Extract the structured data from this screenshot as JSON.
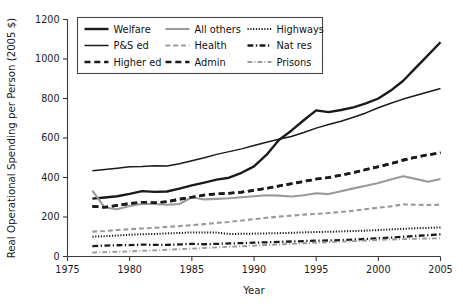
{
  "chart_data": {
    "type": "line",
    "title": "",
    "xlabel": "Year",
    "ylabel": "Real Operational Spending per Person (2005 $)",
    "xlim": [
      1975,
      2005
    ],
    "ylim": [
      0,
      1200
    ],
    "xticks": [
      1975,
      1980,
      1985,
      1990,
      1995,
      2000,
      2005
    ],
    "yticks": [
      0,
      200,
      400,
      600,
      800,
      1000,
      1200
    ],
    "grid": false,
    "legend_position": "top-left",
    "x": [
      1977,
      1978,
      1979,
      1980,
      1981,
      1982,
      1983,
      1984,
      1985,
      1986,
      1987,
      1988,
      1989,
      1990,
      1991,
      1992,
      1993,
      1994,
      1995,
      1996,
      1997,
      1998,
      1999,
      2000,
      2001,
      2002,
      2003,
      2004,
      2005
    ],
    "series": [
      {
        "name": "Welfare",
        "style": "solid",
        "color": "#1a1a1a",
        "width": 2.4,
        "values": [
          293,
          299,
          305,
          317,
          331,
          327,
          329,
          344,
          360,
          374,
          389,
          399,
          424,
          456,
          514,
          590,
          637,
          690,
          740,
          731,
          742,
          755,
          775,
          800,
          840,
          890,
          955,
          1020,
          1085
        ]
      },
      {
        "name": "P&S ed",
        "style": "solid",
        "color": "#1a1a1a",
        "width": 1.5,
        "values": [
          434,
          440,
          447,
          454,
          456,
          460,
          458,
          470,
          485,
          500,
          517,
          531,
          545,
          562,
          578,
          594,
          608,
          628,
          650,
          668,
          685,
          705,
          727,
          753,
          776,
          797,
          815,
          833,
          851
        ]
      },
      {
        "name": "Higher ed",
        "style": "dashed",
        "color": "#1a1a1a",
        "width": 2.6,
        "values": [
          254,
          249,
          259,
          268,
          275,
          272,
          277,
          290,
          300,
          311,
          317,
          320,
          326,
          335,
          345,
          357,
          368,
          380,
          392,
          400,
          412,
          425,
          440,
          455,
          470,
          488,
          503,
          515,
          525
        ]
      },
      {
        "name": "All others",
        "style": "solid",
        "color": "#9a9a9a",
        "width": 2.1,
        "values": [
          334,
          248,
          239,
          256,
          267,
          266,
          262,
          266,
          300,
          289,
          292,
          295,
          300,
          305,
          310,
          308,
          304,
          310,
          320,
          316,
          330,
          345,
          358,
          372,
          390,
          406,
          393,
          378,
          392
        ]
      },
      {
        "name": "Health",
        "style": "dashed",
        "color": "#9a9a9a",
        "width": 2.1,
        "values": [
          126,
          129,
          134,
          138,
          142,
          145,
          150,
          154,
          159,
          164,
          170,
          175,
          182,
          189,
          196,
          202,
          207,
          212,
          216,
          220,
          225,
          232,
          240,
          247,
          254,
          264,
          262,
          261,
          262
        ]
      },
      {
        "name": "Admin",
        "style": "dashed",
        "color": "#1a1a1a",
        "width": 2.6,
        "values": [
          254,
          249,
          259,
          268,
          275,
          272,
          277,
          290,
          300,
          311,
          317,
          320,
          326,
          335,
          345,
          357,
          368,
          380,
          392,
          400,
          412,
          425,
          440,
          455,
          470,
          488,
          503,
          515,
          525
        ]
      },
      {
        "name": "Highways",
        "style": "dotted",
        "color": "#1a1a1a",
        "width": 2.0,
        "values": [
          100,
          103,
          106,
          110,
          113,
          114,
          117,
          119,
          122,
          122,
          121,
          114,
          115,
          116,
          117,
          118,
          120,
          122,
          124,
          125,
          127,
          129,
          131,
          134,
          137,
          140,
          143,
          145,
          147
        ]
      },
      {
        "name": "Nat res",
        "style": "dashdot",
        "color": "#1a1a1a",
        "width": 2.3,
        "values": [
          53,
          55,
          57,
          58,
          60,
          59,
          59,
          61,
          64,
          62,
          64,
          66,
          68,
          70,
          72,
          74,
          76,
          78,
          80,
          81,
          83,
          86,
          89,
          92,
          96,
          100,
          104,
          108,
          112
        ]
      },
      {
        "name": "Prisons",
        "style": "dashdot",
        "color": "#9a9a9a",
        "width": 1.9,
        "values": [
          20,
          22,
          24,
          26,
          29,
          31,
          34,
          37,
          40,
          43,
          46,
          49,
          52,
          55,
          58,
          61,
          64,
          67,
          70,
          72,
          75,
          78,
          81,
          84,
          86,
          88,
          90,
          91,
          92
        ]
      }
    ],
    "legend_entries": [
      {
        "label": "Welfare",
        "style": "solid",
        "color": "#1a1a1a",
        "width": 2.4
      },
      {
        "label": "All others",
        "style": "solid",
        "color": "#9a9a9a",
        "width": 2.1
      },
      {
        "label": "Highways",
        "style": "dotted",
        "color": "#1a1a1a",
        "width": 2.0
      },
      {
        "label": "P&S ed",
        "style": "solid",
        "color": "#1a1a1a",
        "width": 1.5
      },
      {
        "label": "Health",
        "style": "dashed",
        "color": "#9a9a9a",
        "width": 2.1
      },
      {
        "label": "Nat res",
        "style": "dashdot",
        "color": "#1a1a1a",
        "width": 2.3
      },
      {
        "label": "Higher ed",
        "style": "dashed",
        "color": "#1a1a1a",
        "width": 2.6
      },
      {
        "label": "Admin",
        "style": "dashed",
        "color": "#1a1a1a",
        "width": 2.6
      },
      {
        "label": "Prisons",
        "style": "dashdot",
        "color": "#9a9a9a",
        "width": 1.9
      }
    ]
  }
}
